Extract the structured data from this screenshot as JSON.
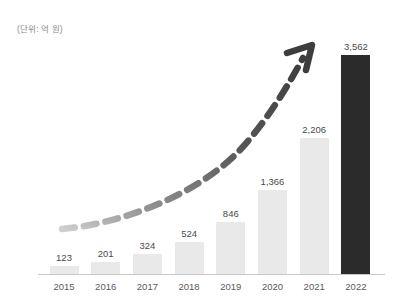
{
  "chart_data": {
    "type": "bar",
    "title": "",
    "subtitle": "",
    "unit_note": "(단위: 억 원)",
    "xlabel": "",
    "ylabel": "",
    "categories": [
      "2015",
      "2016",
      "2017",
      "2018",
      "2019",
      "2020",
      "2021",
      "2022"
    ],
    "values": [
      123,
      201,
      324,
      524,
      846,
      1366,
      2206,
      3562
    ],
    "value_labels": [
      "123",
      "201",
      "324",
      "524",
      "846",
      "1,366",
      "2,206",
      "3,562"
    ],
    "ylim": [
      0,
      3562
    ],
    "grid": false,
    "legend": null,
    "annotations": [
      {
        "name": "growth-trend-arrow",
        "style": "dashed curved arrow",
        "direction": "upward to the right",
        "color": "#4d4d4d"
      }
    ],
    "series": [
      {
        "name": "연도별 실적",
        "values": [
          123,
          201,
          324,
          524,
          846,
          1366,
          2206,
          3562
        ]
      }
    ],
    "bar_colors": {
      "default": "#e9e9e9",
      "highlight": "#2b2b2b",
      "highlight_category": "2022"
    },
    "axis": {
      "baseline_color": "#c9c9c9",
      "tick_label_color": "#5a5a5a",
      "value_label_color": "#4a4a4a"
    }
  }
}
